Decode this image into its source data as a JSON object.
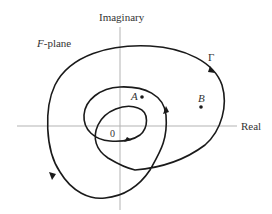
{
  "diagram": {
    "title": "F-plane",
    "title_prefix": "F",
    "title_suffix": "-plane",
    "axes": {
      "vertical_label": "Imaginary",
      "horizontal_label": "Real",
      "axis_color": "#b3b3b3"
    },
    "contour": {
      "label": "Γ",
      "stroke_color": "#1a1a1a",
      "arrow_count": 4
    },
    "points": [
      {
        "label": "A",
        "x": 142,
        "y": 97
      },
      {
        "label": "B",
        "x": 201,
        "y": 107
      }
    ],
    "origin_label": "0"
  }
}
